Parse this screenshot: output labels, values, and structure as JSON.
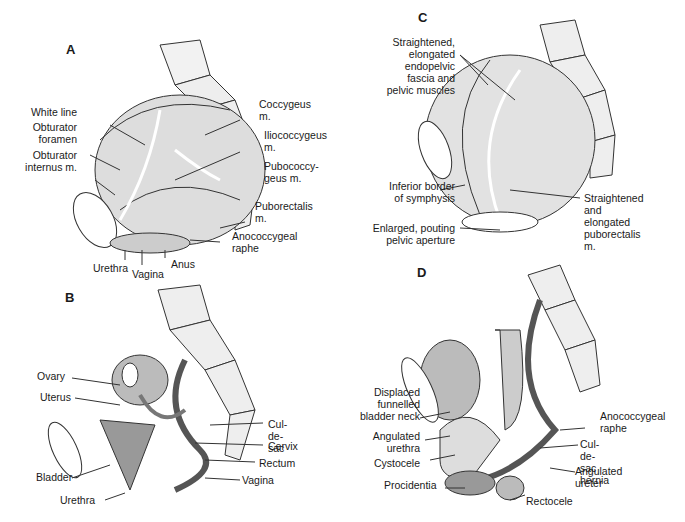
{
  "panels": {
    "A": {
      "letter": "A",
      "labels": {
        "white_line": "White line",
        "obturator_foramen": "Obturator\nforamen",
        "obturator_internus": "Obturator\ninternus m.",
        "coccygeus": "Coccygeus\nm.",
        "iliococcygeus": "Iliococcygeus\nm.",
        "pubococcygeus": "Pubococcy-\ngeus m.",
        "puborectalis": "Puborectalis\nm.",
        "anococcygeal": "Anococcygeal\nraphe",
        "urethra": "Urethra",
        "vagina": "Vagina",
        "anus": "Anus"
      }
    },
    "B": {
      "letter": "B",
      "labels": {
        "ovary": "Ovary",
        "uterus": "Uterus",
        "bladder": "Bladder",
        "urethra": "Urethra",
        "cul_de_sac": "Cul-de-sac",
        "cervix": "Cervix",
        "rectum": "Rectum",
        "vagina": "Vagina"
      }
    },
    "C": {
      "letter": "C",
      "labels": {
        "straightened_fascia": "Straightened,\nelongated\nendopelvic\nfascia and\npelvic muscles",
        "inferior_border": "Inferior border\nof symphysis",
        "enlarged_aperture": "Enlarged, pouting\npelvic aperture",
        "straightened_puborectalis": "Straightened\nand elongated\npuborectalis m."
      }
    },
    "D": {
      "letter": "D",
      "labels": {
        "displaced_bladder_neck": "Displaced\nfunnelled\nbladder neck",
        "angulated_urethra": "Angulated\nurethra",
        "cystocele": "Cystocele",
        "procidentia": "Procidentia",
        "anococcygeal": "Anococcygeal\nraphe",
        "cul_de_sac_hernia": "Cul-de-sac\nhernia",
        "angulated_ureter": "Angulated\nureter",
        "rectocele": "Rectocele"
      }
    }
  }
}
